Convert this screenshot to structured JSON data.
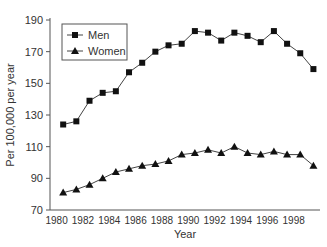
{
  "chart_data": {
    "type": "line",
    "title": "",
    "xlabel": "Year",
    "ylabel": "Per 100,000 per year",
    "ylim": [
      70,
      190
    ],
    "yticks": [
      70,
      90,
      110,
      130,
      150,
      170,
      190
    ],
    "xticks": [
      "1980",
      "1982",
      "1984",
      "1986",
      "1988",
      "1990",
      "1992",
      "1994",
      "1996",
      "1998"
    ],
    "x": [
      1980.5,
      1981.5,
      1982.5,
      1983.5,
      1984.5,
      1985.5,
      1986.5,
      1987.5,
      1988.5,
      1989.5,
      1990.5,
      1991.5,
      1992.5,
      1993.5,
      1994.5,
      1995.5,
      1996.5,
      1997.5,
      1998.5,
      1999.5
    ],
    "series": [
      {
        "name": "Men",
        "marker": "square",
        "values": [
          124,
          126,
          139,
          144,
          145,
          157,
          163,
          170,
          174,
          175,
          183,
          182,
          177,
          182,
          180,
          176,
          183,
          175,
          169,
          159
        ]
      },
      {
        "name": "Women",
        "marker": "triangle",
        "values": [
          81,
          83,
          86,
          90,
          94,
          96,
          98,
          99,
          101,
          105,
          106,
          108,
          106,
          110,
          106,
          105,
          107,
          105,
          105,
          98
        ]
      }
    ],
    "grid": false,
    "legend_position": "upper-left"
  }
}
